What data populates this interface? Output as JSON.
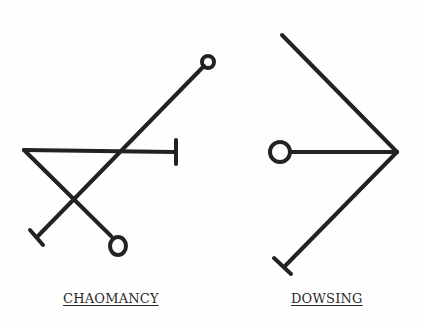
{
  "sigils": [
    {
      "name": "CHAOMANCY",
      "label": "CHAOMANCY"
    },
    {
      "name": "DOWSING",
      "label": "DOWSING"
    }
  ],
  "colors": {
    "ink": "#222222",
    "background": "#fefefe"
  }
}
